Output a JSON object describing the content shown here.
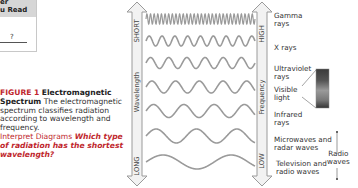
{
  "table_fragment": {
    "header_lines": [
      "er",
      "u Read"
    ],
    "answer_mark": "?"
  },
  "caption": {
    "figure_number": "FIGURE 1",
    "figure_title": "Electromagnetic Spectrum",
    "text": "The electromagnetic spectrum classifies radiation according to wavelength and frequency.",
    "skill_label": "Interpret Diagrams",
    "question": "Which type of radiation has the shortest wavelength?"
  },
  "diagram": {
    "wavelength_axis": {
      "label": "Wavelength",
      "top": "SHORT",
      "bottom": "LONG"
    },
    "frequency_axis": {
      "label": "Frequency",
      "top": "HIGH",
      "bottom": "LOW"
    },
    "bands": [
      {
        "label_lines": [
          "Gamma",
          "rays"
        ]
      },
      {
        "label_lines": [
          "X rays"
        ]
      },
      {
        "label_lines": [
          "Ultraviolet",
          "rays"
        ]
      },
      {
        "label_lines": [
          "Visible",
          "light"
        ]
      },
      {
        "label_lines": [
          "Infrared",
          "rays"
        ]
      },
      {
        "label_lines": [
          "Microwaves and",
          "radar waves"
        ]
      },
      {
        "label_lines": [
          "Television and",
          "radio waves"
        ]
      }
    ],
    "radio_group_label": [
      "Radio",
      "waves"
    ],
    "colors": {
      "wave": "#9a9a9a",
      "arrow_fill": "#f2f2f2",
      "arrow_stroke": "#9a9a9a",
      "caption_accent": "#c0272d"
    }
  }
}
